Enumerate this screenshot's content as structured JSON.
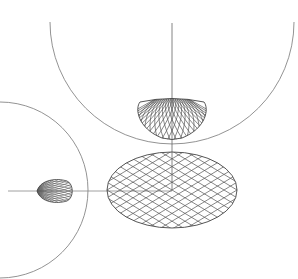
{
  "diagram": {
    "type": "technical-drawing",
    "colors": {
      "background": "#ffffff",
      "line": "#555555",
      "lattice": "#444444",
      "arc": "#777777"
    },
    "big_arc": {
      "cx": 172,
      "cy": 22,
      "r": 122
    },
    "left_arc": {
      "cx": 0,
      "cy": 190,
      "r": 88
    },
    "vertical_axis": {
      "x": 172,
      "y1": 23,
      "y2": 190
    },
    "horizontal_axis": {
      "y": 191,
      "x1": 8,
      "x2": 172
    },
    "top_view_dome": {
      "cx": 172,
      "top": 100,
      "bottom": 140,
      "half_width": 35
    },
    "plan_ellipse": {
      "cx": 172,
      "cy": 190,
      "rx": 65,
      "ry": 38
    },
    "side_egg": {
      "cx": 55,
      "cy": 191,
      "rx": 18,
      "ry": 12
    }
  }
}
